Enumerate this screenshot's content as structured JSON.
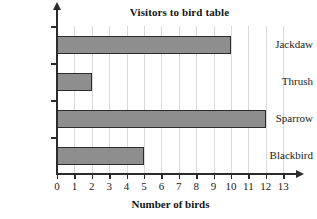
{
  "chart_data": {
    "type": "bar",
    "orientation": "horizontal",
    "title": "Visitors to bird table",
    "xlabel": "Number of birds",
    "ylabel": "",
    "categories": [
      "Blackbird",
      "Sparrow",
      "Thrush",
      "Jackdaw"
    ],
    "values": [
      5,
      12,
      2,
      10
    ],
    "xticks": [
      0,
      1,
      2,
      3,
      4,
      5,
      6,
      7,
      8,
      9,
      10,
      11,
      12,
      13
    ],
    "xtick_labels": [
      "0",
      "1",
      "2",
      "3",
      "4",
      "5",
      "6",
      "7",
      "8",
      "9",
      "10",
      "11",
      "12",
      "13"
    ],
    "xlim": [
      0,
      13
    ],
    "grid": true,
    "grid_axis": "x",
    "legend": false,
    "colors": {
      "bar_fill": "#8e8e8e",
      "bar_border": "#2b2b2b",
      "gridline": "#d9d9d9",
      "axis": "#2b2b2b",
      "text": "#1a1a1a",
      "background": "#ffffff"
    }
  }
}
